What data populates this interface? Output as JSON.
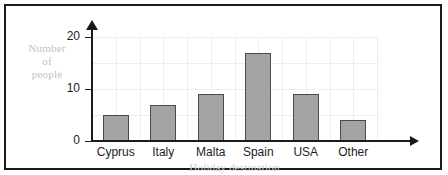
{
  "chart_data": {
    "type": "bar",
    "title": "",
    "subtitle": "",
    "xlabel": "Holiday destination",
    "ylabel": "Number of people",
    "ylabel_lines": [
      "Number",
      "of",
      "people"
    ],
    "categories": [
      "Cyprus",
      "Italy",
      "Malta",
      "Spain",
      "USA",
      "Other"
    ],
    "values": [
      5,
      7,
      9,
      17,
      9,
      4
    ],
    "ylim": [
      0,
      20
    ],
    "ytick_labels": [
      "0",
      "10",
      "20"
    ],
    "ytick_values": [
      0,
      10,
      20
    ],
    "gridline_values": [
      5,
      10,
      15,
      20
    ],
    "grid": true,
    "legend": "none",
    "bar_color": "#a3a3a3",
    "bar_edge_color": "#4a4a4a",
    "axis_color": "#1a1a1a",
    "grid_color": "#ededed",
    "label_color": "#1d1d1d",
    "axis_title_color": "#c2c2c2",
    "background_color": "#ffffff"
  }
}
